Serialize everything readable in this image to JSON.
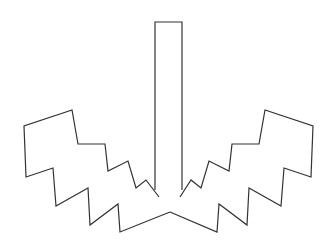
{
  "figure": {
    "stroke_color": "#333333",
    "background_color": "#ffffff",
    "shapes": {
      "stem": "155,190 155,22 182,22 182,190",
      "left_wing": "159,197 146,180 136,188 128,161 108,171 105,144 78,144 72,110 24,126 26,177 53,168 56,206 88,188 90,225 118,204 120,232 170,212",
      "right_wing": "180,197 191,180 201,188 209,161 229,171 232,144 259,144 265,110 313,126 311,177 284,168 281,206 249,188 247,225 219,204 217,232 170,212"
    }
  }
}
